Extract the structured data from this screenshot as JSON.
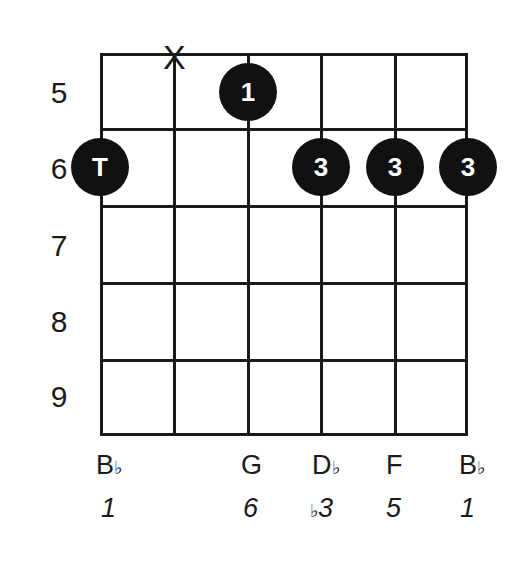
{
  "chord": {
    "fret_labels": [
      "5",
      "6",
      "7",
      "8",
      "9"
    ],
    "muted_marker": "X",
    "fingers": [
      {
        "string": 1,
        "fret": 6,
        "label": "T"
      },
      {
        "string": 3,
        "fret": 5,
        "label": "1"
      },
      {
        "string": 4,
        "fret": 6,
        "label": "3"
      },
      {
        "string": 5,
        "fret": 6,
        "label": "3"
      },
      {
        "string": 6,
        "fret": 6,
        "label": "3"
      }
    ],
    "notes": [
      {
        "name": "B",
        "accidental": "♭"
      },
      {
        "name": "",
        "accidental": ""
      },
      {
        "name": "G",
        "accidental": ""
      },
      {
        "name": "D",
        "accidental": "♭"
      },
      {
        "name": "F",
        "accidental": ""
      },
      {
        "name": "B",
        "accidental": "♭"
      }
    ],
    "degrees": [
      {
        "acc": "",
        "num": "1"
      },
      {
        "acc": "",
        "num": ""
      },
      {
        "acc": "",
        "num": "6"
      },
      {
        "acc": "♭",
        "num": "3"
      },
      {
        "acc": "",
        "num": "5"
      },
      {
        "acc": "",
        "num": "1"
      }
    ]
  }
}
